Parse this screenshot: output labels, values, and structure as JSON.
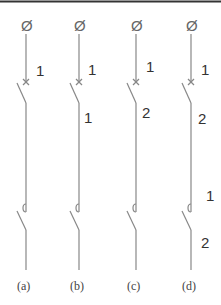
{
  "figure": {
    "top_rule": true,
    "line_color": "#888888",
    "panels": [
      {
        "id": "a",
        "caption": "(a)",
        "x": 26,
        "phi": "Ø",
        "labels": [
          {
            "text": "1",
            "x": 36,
            "y": 76
          }
        ]
      },
      {
        "id": "b",
        "caption": "(b)",
        "x": 79,
        "phi": "Ø",
        "labels": [
          {
            "text": "1",
            "x": 88,
            "y": 75
          },
          {
            "text": "1",
            "x": 84,
            "y": 123
          }
        ]
      },
      {
        "id": "c",
        "caption": "(c)",
        "x": 136,
        "phi": "Ø",
        "labels": [
          {
            "text": "1",
            "x": 146,
            "y": 72
          },
          {
            "text": "2",
            "x": 142,
            "y": 118
          }
        ]
      },
      {
        "id": "d",
        "caption": "(d)",
        "x": 191,
        "phi": "Ø",
        "labels": [
          {
            "text": "1",
            "x": 201,
            "y": 75
          },
          {
            "text": "2",
            "x": 198,
            "y": 124
          },
          {
            "text": "1",
            "x": 206,
            "y": 201
          },
          {
            "text": "2",
            "x": 201,
            "y": 248
          }
        ]
      }
    ]
  }
}
